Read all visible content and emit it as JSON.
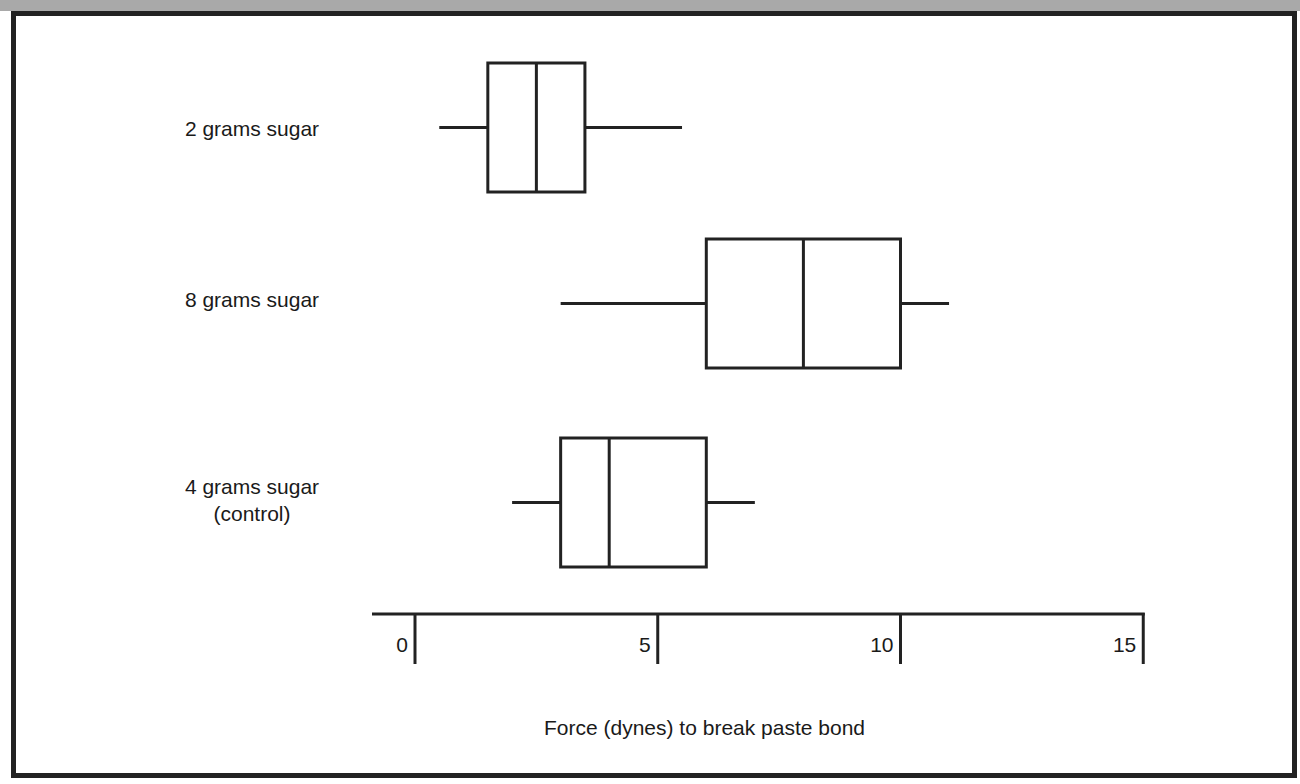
{
  "chart_data": {
    "type": "boxplot",
    "title": "",
    "xlabel": "Force (dynes) to break paste bond",
    "ylabel": "",
    "xlim": [
      0,
      15
    ],
    "xticks": [
      0,
      5,
      10,
      15
    ],
    "grid": false,
    "legend": null,
    "categories": [
      "2 grams sugar",
      "8 grams sugar",
      "4 grams sugar (control)"
    ],
    "series": [
      {
        "name": "2 grams sugar",
        "label_lines": [
          "2 grams sugar"
        ],
        "min": 0.5,
        "q1": 1.5,
        "median": 2.5,
        "q3": 3.5,
        "max": 5.5
      },
      {
        "name": "8 grams sugar",
        "label_lines": [
          "8 grams sugar"
        ],
        "min": 3,
        "q1": 6,
        "median": 8,
        "q3": 10,
        "max": 11
      },
      {
        "name": "4 grams sugar (control)",
        "label_lines": [
          "4 grams sugar",
          "(control)"
        ],
        "min": 2,
        "q1": 3,
        "median": 4,
        "q3": 6,
        "max": 7
      }
    ]
  },
  "colors": {
    "stroke": "#222222",
    "background": "#ffffff",
    "frame": "#222222",
    "top_band": "#a9a9a9"
  }
}
